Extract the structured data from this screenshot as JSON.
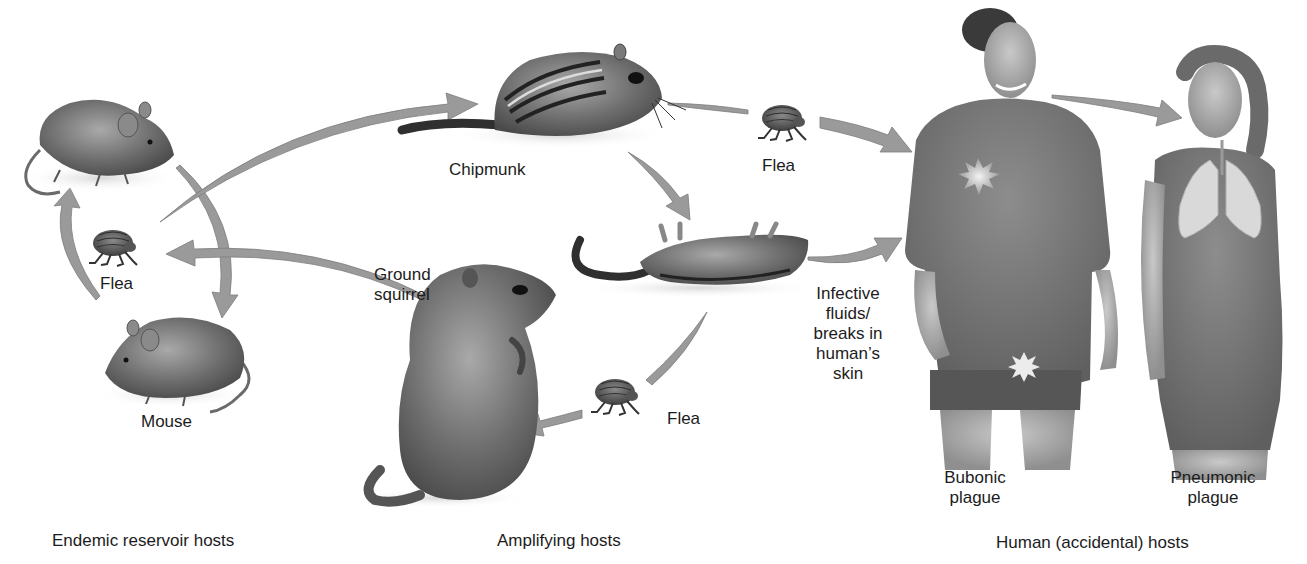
{
  "diagram": {
    "colors": {
      "background": "#ffffff",
      "arrow_fill": "#9a9a9a",
      "arrow_stroke": "#7c7c7c",
      "text": "#1c1c1c",
      "animal_fur": "#6f6f6f",
      "human_shirt": "#7a7a7a",
      "lesion_highlight": "#e6e6e6"
    },
    "groups": [
      {
        "id": "endemic",
        "label": "Endemic reservoir hosts"
      },
      {
        "id": "amplifying",
        "label": "Amplifying hosts"
      },
      {
        "id": "human",
        "label": "Human (accidental) hosts"
      }
    ],
    "nodes": {
      "mouse_top": {
        "label": ""
      },
      "flea_left": {
        "label": "Flea"
      },
      "mouse_bottom": {
        "label": "Mouse"
      },
      "chipmunk": {
        "label": "Chipmunk"
      },
      "ground_squirrel": {
        "label_line1": "Ground",
        "label_line2": "squirrel"
      },
      "flea_top": {
        "label": "Flea"
      },
      "dead_rodent": {
        "label": ""
      },
      "flea_bottom": {
        "label": "Flea"
      },
      "infective_note": {
        "lines": [
          "Infective",
          "fluids/",
          "breaks in",
          "human’s",
          "skin"
        ]
      },
      "man": {
        "label_line1": "Bubonic",
        "label_line2": "plague"
      },
      "woman": {
        "label_line1": "Pneumonic",
        "label_line2": "plague"
      }
    },
    "icons": [
      "mouse-icon",
      "flea-icon",
      "chipmunk-icon",
      "ground-squirrel-icon",
      "dead-rodent-icon",
      "human-male-icon",
      "human-female-icon",
      "lungs-icon",
      "bubo-lesion-icon"
    ],
    "arrows": [
      {
        "from": "flea_left",
        "to": "mouse_top"
      },
      {
        "from": "mouse_top",
        "to": "mouse_bottom"
      },
      {
        "from": "flea_left",
        "to": "chipmunk"
      },
      {
        "from": "ground_squirrel",
        "to": "flea_left"
      },
      {
        "from": "chipmunk",
        "to": "flea_top"
      },
      {
        "from": "flea_top",
        "to": "man"
      },
      {
        "from": "chipmunk",
        "to": "dead_rodent"
      },
      {
        "from": "dead_rodent",
        "to": "man"
      },
      {
        "from": "dead_rodent",
        "to": "flea_bottom"
      },
      {
        "from": "flea_bottom",
        "to": "ground_squirrel"
      },
      {
        "from": "man",
        "to": "woman"
      }
    ]
  }
}
